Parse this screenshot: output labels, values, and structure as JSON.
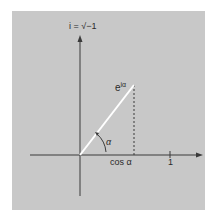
{
  "diagram": {
    "y_axis_label": "i = √−1",
    "vector_label": "e",
    "vector_exponent": "iα",
    "angle_label": "α",
    "x_projection_label": "cos α",
    "x_tick_label": "1",
    "colors": {
      "background": "#c8c8c8",
      "axis": "#3a3a3a",
      "vector": "#ffffff",
      "dashed": "#3a3a3a"
    }
  }
}
